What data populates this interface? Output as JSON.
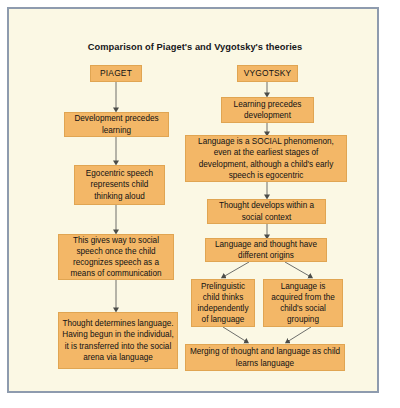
{
  "figure": {
    "title": "Comparison of Piaget's and Vygotsky's theories",
    "frame_border_color": "#8e9bae",
    "background_color": "#fbf8e4",
    "node_fill_color": "#f3b767",
    "connector_color": "#6e6f6b"
  },
  "piaget": {
    "header": "PIAGET",
    "nodes": [
      "Development precedes learning",
      "Egocentric speech represents child thinking aloud",
      "This gives way to social speech once the child recognizes speech as a means of communication",
      "Thought determines language. Having begun in the individual, it is transferred into the social arena via language"
    ]
  },
  "vygotsky": {
    "header": "VYGOTSKY",
    "nodes": [
      "Learning precedes development",
      "Language is a SOCIAL phenomenon, even at the earliest stages of development, although a child's early speech is egocentric",
      "Thought develops within a social context",
      "Language and thought have different origins",
      "Prelinguistic child thinks independently of language",
      "Language is acquired from the child's social grouping",
      "Merging of thought and language as child learns language"
    ]
  }
}
